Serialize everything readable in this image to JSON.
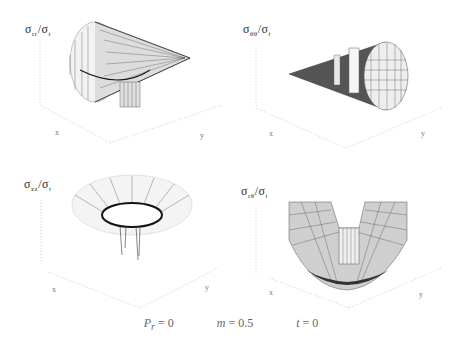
{
  "figure": {
    "panels": [
      {
        "id": "p1",
        "label_num": "σ",
        "label_num_sub": "rr",
        "label_den": "σ",
        "label_den_sub": "t",
        "axis_labels": [
          "x",
          "y"
        ],
        "shape": "cone-right"
      },
      {
        "id": "p2",
        "label_num": "σ",
        "label_num_sub": "θθ",
        "label_den": "σ",
        "label_den_sub": "t",
        "axis_labels": [
          "x",
          "y"
        ],
        "shape": "cone-left"
      },
      {
        "id": "p3",
        "label_num": "σ",
        "label_num_sub": "zz",
        "label_den": "σ",
        "label_den_sub": "t",
        "axis_labels": [
          "x",
          "y"
        ],
        "shape": "funnel"
      },
      {
        "id": "p4",
        "label_num": "σ",
        "label_num_sub": "rθ",
        "label_den": "σ",
        "label_den_sub": "t",
        "axis_labels": [
          "x",
          "y"
        ],
        "shape": "v-trough"
      }
    ],
    "caption": {
      "p1": "P",
      "p1_sub": "r",
      "p1_val": "= 0",
      "p2": "m",
      "p2_val": "= 0.5",
      "p3": "t",
      "p3_val": "= 0"
    }
  }
}
